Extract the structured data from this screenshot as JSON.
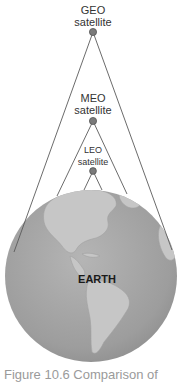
{
  "diagram": {
    "satellites": [
      {
        "id": "geo",
        "line1": "GEO",
        "line2": "satellite"
      },
      {
        "id": "meo",
        "line1": "MEO",
        "line2": "satellite"
      },
      {
        "id": "leo",
        "line1": "LEO",
        "line2": "satellite"
      }
    ],
    "earth_label": "EARTH",
    "colors": {
      "line": "#555555",
      "satellite_fill": "#7a7a7a",
      "globe_ocean": "#a9a9a9",
      "globe_land": "#c4c4c4",
      "caption": "#9a9a9a"
    }
  },
  "caption": "Figure 10.6 Comparison of"
}
